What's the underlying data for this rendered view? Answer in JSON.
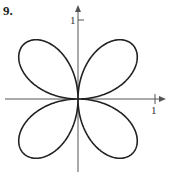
{
  "problem_number": "9.",
  "axes": {
    "y_tick_label": "1",
    "x_tick_label": "1",
    "origin_px": [
      78,
      99
    ],
    "unit_px": 77
  },
  "curve": {
    "type": "polar-rose",
    "equation_shape": "r = sin(2θ) style four-petal rose",
    "petals": 4,
    "petal_directions": [
      "upper-left",
      "upper-right",
      "lower-left",
      "lower-right"
    ],
    "stroke_color": "#222222"
  },
  "colors": {
    "background": "#ffffff",
    "axis": "#555555",
    "curve": "#222222"
  }
}
